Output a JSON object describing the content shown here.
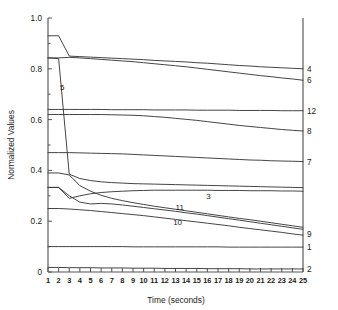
{
  "figure": {
    "background": "#ffffff",
    "line_color": "#3b3b3b",
    "axis_color": "#555555"
  },
  "chart_data": {
    "type": "line",
    "title": "",
    "subtitle": "",
    "xlabel": "Time (seconds)",
    "ylabel": "Normalized Values",
    "xlim": [
      1,
      25
    ],
    "ylim": [
      0,
      1.0
    ],
    "grid": false,
    "legend_position": "right-axis-labels",
    "x_ticks": [
      1,
      2,
      3,
      4,
      5,
      6,
      7,
      8,
      9,
      10,
      11,
      12,
      13,
      14,
      15,
      16,
      17,
      18,
      19,
      20,
      21,
      22,
      23,
      24,
      25
    ],
    "x_tick_labels": [
      "1",
      "2",
      "3",
      "4",
      "5",
      "6",
      "7",
      "8",
      "9",
      "10",
      "11",
      "12",
      "13",
      "14",
      "15",
      "16",
      "17",
      "18",
      "19",
      "20",
      "21",
      "22",
      "23",
      "24",
      "25"
    ],
    "y_ticks": [
      0,
      0.2,
      0.4,
      0.6,
      0.8,
      1.0
    ],
    "y_tick_labels": [
      "0",
      "0.2",
      "0.4",
      "0.6",
      "0.8",
      "1.0"
    ],
    "x": [
      1,
      2,
      3,
      4,
      5,
      6,
      7,
      8,
      9,
      10,
      11,
      12,
      13,
      14,
      15,
      16,
      17,
      18,
      19,
      20,
      21,
      22,
      23,
      24,
      25
    ],
    "series": [
      {
        "name": "4",
        "right_label": "4",
        "right_label_value": 0.8,
        "values": [
          0.93,
          0.93,
          0.85,
          0.848,
          0.846,
          0.844,
          0.842,
          0.84,
          0.838,
          0.836,
          0.833,
          0.831,
          0.829,
          0.827,
          0.824,
          0.822,
          0.819,
          0.816,
          0.813,
          0.811,
          0.808,
          0.806,
          0.804,
          0.802,
          0.8
        ]
      },
      {
        "name": "6",
        "right_label": "6",
        "right_label_value": 0.755,
        "values": [
          0.843,
          0.843,
          0.845,
          0.843,
          0.84,
          0.837,
          0.834,
          0.831,
          0.828,
          0.824,
          0.82,
          0.816,
          0.812,
          0.808,
          0.803,
          0.798,
          0.793,
          0.788,
          0.783,
          0.778,
          0.773,
          0.769,
          0.764,
          0.76,
          0.755
        ]
      },
      {
        "name": "12",
        "right_label": "12",
        "right_label_value": 0.635,
        "values": [
          0.64,
          0.64,
          0.64,
          0.64,
          0.64,
          0.64,
          0.639,
          0.639,
          0.639,
          0.639,
          0.638,
          0.638,
          0.638,
          0.638,
          0.637,
          0.637,
          0.637,
          0.637,
          0.636,
          0.636,
          0.636,
          0.636,
          0.635,
          0.635,
          0.635
        ]
      },
      {
        "name": "8",
        "right_label": "8",
        "right_label_value": 0.555,
        "values": [
          0.62,
          0.62,
          0.62,
          0.62,
          0.62,
          0.62,
          0.619,
          0.618,
          0.617,
          0.615,
          0.612,
          0.609,
          0.605,
          0.601,
          0.597,
          0.592,
          0.587,
          0.582,
          0.577,
          0.573,
          0.569,
          0.565,
          0.561,
          0.558,
          0.555
        ]
      },
      {
        "name": "7",
        "right_label": "7",
        "right_label_value": 0.435,
        "values": [
          0.47,
          0.47,
          0.47,
          0.469,
          0.468,
          0.467,
          0.466,
          0.465,
          0.463,
          0.461,
          0.459,
          0.457,
          0.455,
          0.453,
          0.451,
          0.449,
          0.447,
          0.445,
          0.443,
          0.441,
          0.44,
          0.438,
          0.437,
          0.436,
          0.435
        ]
      },
      {
        "name": "5",
        "right_label": "",
        "right_label_value": null,
        "inline_label": "5",
        "values": [
          0.843,
          0.84,
          0.385,
          0.368,
          0.36,
          0.355,
          0.352,
          0.35,
          0.348,
          0.347,
          0.346,
          0.345,
          0.344,
          0.343,
          0.342,
          0.341,
          0.34,
          0.339,
          0.338,
          0.337,
          0.336,
          0.335,
          0.334,
          0.333,
          0.332
        ]
      },
      {
        "name": "3",
        "right_label": "",
        "right_label_value": 0.318,
        "inline_label": "3",
        "values": [
          0.333,
          0.333,
          0.29,
          0.3,
          0.308,
          0.313,
          0.316,
          0.318,
          0.32,
          0.321,
          0.322,
          0.322,
          0.322,
          0.322,
          0.322,
          0.322,
          0.321,
          0.321,
          0.321,
          0.32,
          0.32,
          0.32,
          0.319,
          0.319,
          0.318
        ]
      },
      {
        "name": "11",
        "right_label": "",
        "right_label_value": 0.176,
        "inline_label": "11",
        "values": [
          0.39,
          0.39,
          0.382,
          0.34,
          0.318,
          0.302,
          0.29,
          0.281,
          0.273,
          0.266,
          0.259,
          0.253,
          0.247,
          0.241,
          0.235,
          0.229,
          0.223,
          0.217,
          0.211,
          0.206,
          0.2,
          0.194,
          0.188,
          0.182,
          0.176
        ]
      },
      {
        "name": "10",
        "right_label": "",
        "right_label_value": 0.168,
        "inline_label": "10",
        "values": [
          0.333,
          0.333,
          0.3,
          0.275,
          0.268,
          0.27,
          0.268,
          0.264,
          0.259,
          0.254,
          0.249,
          0.244,
          0.239,
          0.233,
          0.228,
          0.222,
          0.216,
          0.21,
          0.204,
          0.198,
          0.192,
          0.186,
          0.18,
          0.174,
          0.168
        ]
      },
      {
        "name": "9",
        "right_label": "9",
        "right_label_value": 0.145,
        "values": [
          0.25,
          0.25,
          0.248,
          0.245,
          0.242,
          0.238,
          0.234,
          0.23,
          0.226,
          0.222,
          0.217,
          0.212,
          0.207,
          0.202,
          0.197,
          0.192,
          0.187,
          0.182,
          0.176,
          0.171,
          0.166,
          0.161,
          0.156,
          0.15,
          0.145
        ]
      },
      {
        "name": "1",
        "right_label": "1",
        "right_label_value": 0.098,
        "values": [
          0.1,
          0.1,
          0.1,
          0.1,
          0.1,
          0.1,
          0.1,
          0.1,
          0.099,
          0.099,
          0.099,
          0.099,
          0.099,
          0.099,
          0.099,
          0.099,
          0.099,
          0.098,
          0.098,
          0.098,
          0.098,
          0.098,
          0.098,
          0.098,
          0.098
        ]
      },
      {
        "name": "2",
        "right_label": "2",
        "right_label_value": 0.012,
        "values": [
          0.018,
          0.018,
          0.017,
          0.017,
          0.017,
          0.016,
          0.016,
          0.016,
          0.015,
          0.015,
          0.015,
          0.014,
          0.014,
          0.014,
          0.014,
          0.013,
          0.013,
          0.013,
          0.013,
          0.012,
          0.012,
          0.012,
          0.012,
          0.012,
          0.012
        ]
      }
    ],
    "inline_annotations": [
      {
        "text": "5",
        "x": 2.35,
        "y": 0.715
      },
      {
        "text": "3",
        "x": 16.1,
        "y": 0.288
      },
      {
        "text": "11",
        "x": 13.4,
        "y": 0.243
      },
      {
        "text": "10",
        "x": 13.2,
        "y": 0.185
      }
    ],
    "right_axis_labels": [
      {
        "text": "4",
        "y": 0.8
      },
      {
        "text": "6",
        "y": 0.755
      },
      {
        "text": "12",
        "y": 0.635
      },
      {
        "text": "8",
        "y": 0.555
      },
      {
        "text": "7",
        "y": 0.435
      },
      {
        "text": "9",
        "y": 0.15
      },
      {
        "text": "1",
        "y": 0.098
      },
      {
        "text": "2",
        "y": 0.012
      }
    ]
  }
}
